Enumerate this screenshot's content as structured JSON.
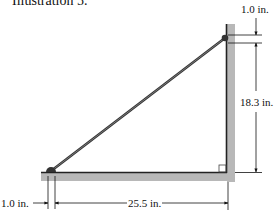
{
  "caption": "Illustration 5.",
  "colors": {
    "structure_fill": "#b8b8b8",
    "structure_edge": "#222222",
    "rod": "#333333",
    "dimension_line": "#111111",
    "background": "#ffffff"
  },
  "dimensions": {
    "top_offset": "1.0 in.",
    "vertical_height": "18.3 in.",
    "bottom_offset": "1.0 in.",
    "horizontal_length": "25.5 in."
  },
  "elements": {
    "vertical_post": "vertical-post",
    "horizontal_base": "horizontal-base",
    "diagonal_rod": "diagonal-rod",
    "right_angle_marker": "right-angle-marker"
  }
}
